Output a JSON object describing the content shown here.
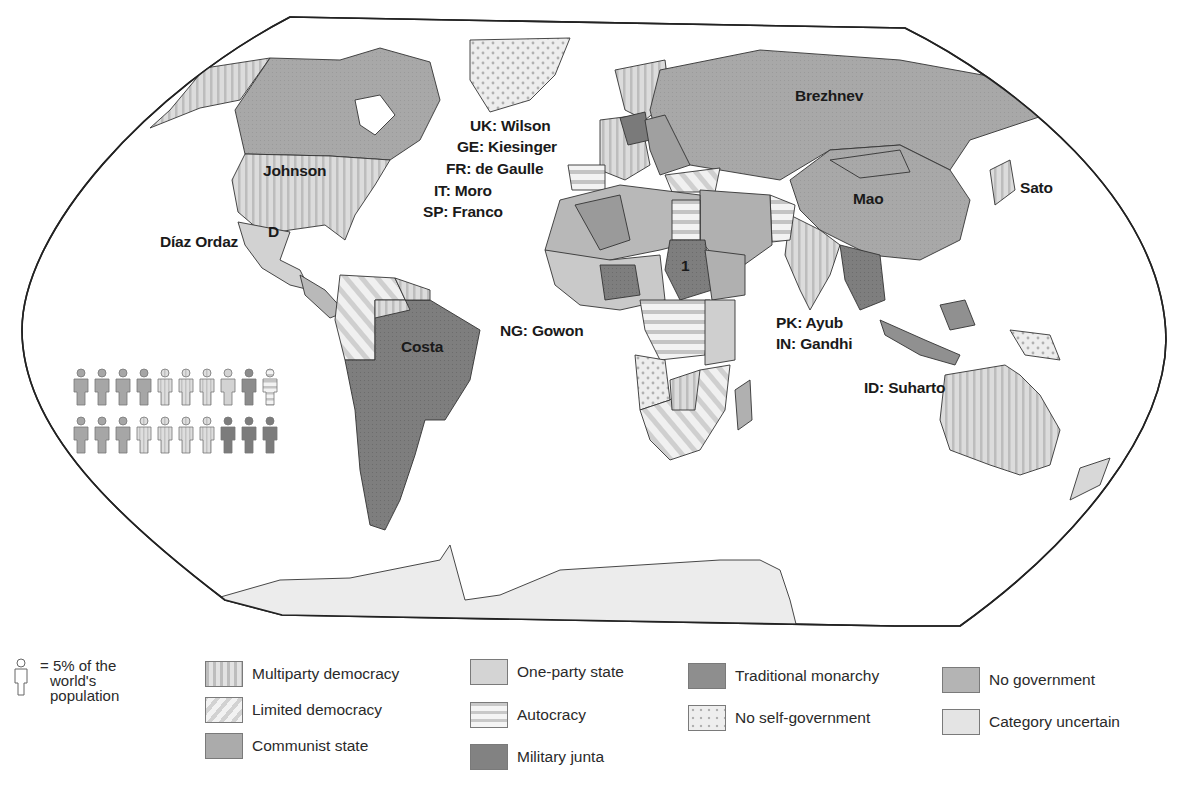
{
  "map": {
    "labels": {
      "johnson": "Johnson",
      "diaz_ordaz": "Díaz Ordaz",
      "mexico_marker": "D",
      "costa": "Costa",
      "uk": "UK: Wilson",
      "ge": "GE: Kiesinger",
      "fr": "FR: de Gaulle",
      "it": "IT: Moro",
      "sp": "SP: Franco",
      "ng": "NG: Gowon",
      "brezhnev": "Brezhnev",
      "mao": "Mao",
      "sato": "Sato",
      "sudan_marker": "1",
      "pk": "PK: Ayub",
      "in": "IN: Gandhi",
      "id": "ID: Suharto"
    },
    "population_figures": {
      "row1": [
        "communist",
        "communist",
        "communist",
        "communist",
        "multiparty",
        "multiparty",
        "multiparty",
        "one-party",
        "traditional-monarchy",
        "autocracy"
      ],
      "row2": [
        "communist",
        "communist",
        "communist",
        "multiparty",
        "multiparty",
        "multiparty",
        "multiparty",
        "military-junta",
        "military-junta",
        "military-junta"
      ]
    }
  },
  "legend": {
    "population_key": {
      "line1": "= 5% of the",
      "line2": "world's",
      "line3": "population"
    },
    "items": [
      {
        "id": "multiparty",
        "label": "Multiparty democracy",
        "pattern": "vertical-stripes"
      },
      {
        "id": "limited",
        "label": "Limited democracy",
        "pattern": "diagonal-stripes"
      },
      {
        "id": "communist",
        "label": "Communist state",
        "pattern": "solid-mid"
      },
      {
        "id": "oneparty",
        "label": "One-party state",
        "pattern": "solid-light"
      },
      {
        "id": "autocracy",
        "label": "Autocracy",
        "pattern": "horizontal-stripes"
      },
      {
        "id": "junta",
        "label": "Military junta",
        "pattern": "solid-dark"
      },
      {
        "id": "monarchy",
        "label": "Traditional monarchy",
        "pattern": "solid-darkmid"
      },
      {
        "id": "noself",
        "label": "No self-government",
        "pattern": "dots"
      },
      {
        "id": "nogov",
        "label": "No government",
        "pattern": "solid-gray"
      },
      {
        "id": "uncertain",
        "label": "Category uncertain",
        "pattern": "solid-pale"
      }
    ]
  },
  "colors": {
    "communist": "#a9a9a9",
    "multiparty": "#d6d6d6",
    "oneparty": "#cfcfcf",
    "junta": "#7f7f7f",
    "monarchy": "#8f8f8f",
    "nogov": "#b4b4b4",
    "uncertain": "#e3e3e3",
    "outline": "#2a2a2a"
  }
}
